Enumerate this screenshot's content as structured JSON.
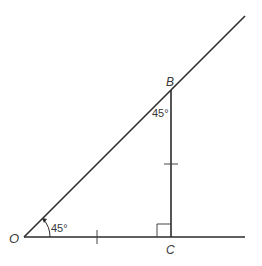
{
  "diagram": {
    "title": "",
    "points": {
      "O": {
        "label": "O"
      },
      "B": {
        "label": "B"
      },
      "C": {
        "label": "C"
      }
    },
    "angles": {
      "at_O": {
        "label": "45°"
      },
      "at_B": {
        "label": "45°"
      }
    },
    "marks": {
      "right_angle_at": "C",
      "equal_segments": [
        "OC",
        "BC"
      ]
    },
    "colors": {
      "line": "#2b2b2b",
      "text": "#3a3a3a",
      "background": "#ffffff"
    }
  }
}
